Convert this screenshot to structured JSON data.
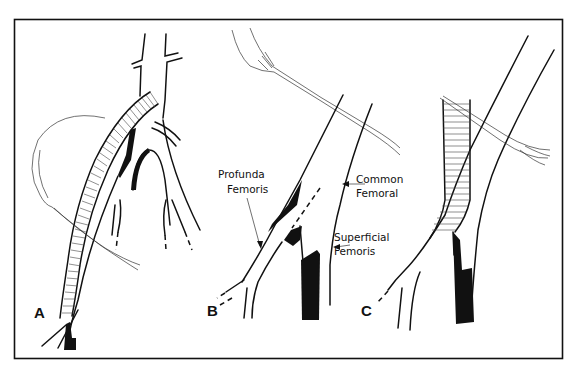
{
  "figure": {
    "frame": {
      "x": 14,
      "y": 19,
      "width": 549,
      "height": 340,
      "stroke": "#111111"
    },
    "colors": {
      "ink": "#111111",
      "paper": "#ffffff"
    },
    "panels": [
      {
        "id": "A",
        "label": "A",
        "content": "Ringed graft from above crossing over iliac bifurcation into femoral artery, with retractor tape loop"
      },
      {
        "id": "B",
        "label": "B",
        "content": "Femoral bifurcation with plaque; tape retracting common femoral"
      },
      {
        "id": "C",
        "label": "C",
        "content": "Ringed graft anastomosed to common femoral, tape crossing vessel"
      }
    ],
    "annotations": [
      {
        "text_lines": [
          "Profunda",
          "Femoris"
        ],
        "panel": "B",
        "arrow": true
      },
      {
        "text_lines": [
          "Common",
          "Femoral"
        ],
        "panel": "B",
        "arrow": true
      },
      {
        "text_lines": [
          "Superficial",
          "Femoris"
        ],
        "panel": "B",
        "arrow": true
      }
    ]
  }
}
